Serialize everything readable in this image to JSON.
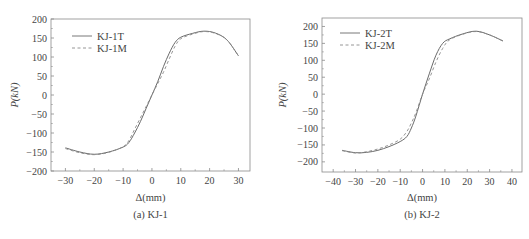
{
  "chart_data": [
    {
      "type": "line",
      "caption": "(a) KJ-1",
      "xlabel": "Δ(mm)",
      "ylabel": "P(kN)",
      "xlim": [
        -35,
        34
      ],
      "ylim": [
        -200,
        200
      ],
      "xticks": [
        -30,
        -20,
        -10,
        0,
        10,
        20,
        30
      ],
      "yticks": [
        -200,
        -150,
        -100,
        -50,
        0,
        50,
        100,
        150,
        200
      ],
      "grid": false,
      "legend_position": "top-left",
      "series": [
        {
          "name": "KJ-1T",
          "style": "solid",
          "x": [
            -30,
            -25,
            -20,
            -15,
            -10,
            -8,
            -6,
            -4,
            -2,
            0,
            2,
            4,
            6,
            8,
            10,
            14,
            18,
            22,
            26,
            30
          ],
          "y": [
            -139,
            -150,
            -156,
            -150,
            -137,
            -125,
            -100,
            -70,
            -35,
            0,
            35,
            75,
            110,
            138,
            152,
            162,
            168,
            163,
            145,
            103
          ]
        },
        {
          "name": "KJ-1M",
          "style": "dashed",
          "x": [
            -30,
            -25,
            -20,
            -15,
            -10,
            -8,
            -6,
            -4,
            -2,
            0,
            2,
            4,
            6,
            8,
            10,
            14,
            18,
            22,
            26,
            30
          ],
          "y": [
            -141,
            -152,
            -157,
            -151,
            -136,
            -120,
            -90,
            -60,
            -30,
            0,
            30,
            60,
            95,
            128,
            148,
            160,
            167,
            162,
            145,
            103
          ]
        }
      ]
    },
    {
      "type": "line",
      "caption": "(b) KJ-2",
      "xlabel": "Δ(mm)",
      "ylabel": "P(kN)",
      "xlim": [
        -45,
        44.5
      ],
      "ylim": [
        -230,
        225
      ],
      "xticks": [
        -40,
        -30,
        -20,
        -10,
        0,
        10,
        20,
        30,
        40
      ],
      "yticks": [
        -200,
        -150,
        -100,
        -50,
        0,
        50,
        100,
        150,
        200
      ],
      "grid": false,
      "legend_position": "top-left",
      "series": [
        {
          "name": "KJ-2T",
          "style": "solid",
          "x": [
            -36,
            -30,
            -25,
            -20,
            -15,
            -10,
            -7,
            -5,
            -3,
            0,
            3,
            6,
            9,
            12,
            18,
            24,
            30,
            36
          ],
          "y": [
            -166,
            -173,
            -172,
            -166,
            -155,
            -140,
            -125,
            -100,
            -65,
            0,
            60,
            115,
            150,
            163,
            178,
            186,
            175,
            157
          ]
        },
        {
          "name": "KJ-2M",
          "style": "dashed",
          "x": [
            -36,
            -30,
            -25,
            -20,
            -15,
            -10,
            -7,
            -5,
            -3,
            0,
            3,
            6,
            9,
            12,
            18,
            24,
            30,
            36
          ],
          "y": [
            -167,
            -174,
            -170,
            -162,
            -150,
            -133,
            -110,
            -85,
            -55,
            0,
            45,
            95,
            135,
            160,
            177,
            185,
            175,
            157
          ]
        }
      ]
    }
  ],
  "colors": {
    "axis": "#8a8a8a",
    "line_solid": "#6a6a6a",
    "line_dashed": "#8a8a8a",
    "text": "#444444"
  }
}
